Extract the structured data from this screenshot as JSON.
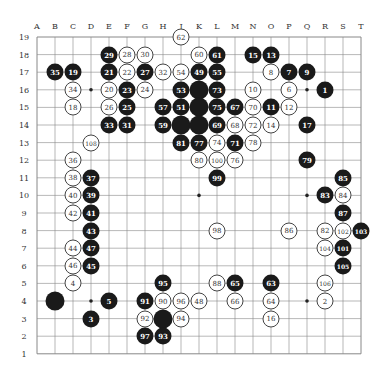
{
  "diagram": {
    "type": "go-game-record",
    "board_size": 19,
    "columns": [
      "A",
      "B",
      "C",
      "D",
      "E",
      "F",
      "G",
      "H",
      "J",
      "K",
      "L",
      "M",
      "N",
      "O",
      "P",
      "Q",
      "R",
      "S",
      "T"
    ],
    "rows": [
      19,
      18,
      17,
      16,
      15,
      14,
      13,
      12,
      11,
      10,
      9,
      8,
      7,
      6,
      5,
      4,
      3,
      2,
      1
    ],
    "star_points": [
      "D4",
      "K4",
      "Q4",
      "D10",
      "K10",
      "Q10",
      "D16",
      "K16",
      "Q16"
    ],
    "stones": [
      {
        "pos": "J19",
        "color": "white",
        "label": "62"
      },
      {
        "pos": "E18",
        "color": "black",
        "label": "29"
      },
      {
        "pos": "F18",
        "color": "white",
        "label": "28"
      },
      {
        "pos": "G18",
        "color": "white",
        "label": "30"
      },
      {
        "pos": "K18",
        "color": "white",
        "label": "60"
      },
      {
        "pos": "L18",
        "color": "black",
        "label": "61"
      },
      {
        "pos": "N18",
        "color": "black",
        "label": "15"
      },
      {
        "pos": "O18",
        "color": "black",
        "label": "13"
      },
      {
        "pos": "B17",
        "color": "black",
        "label": "35"
      },
      {
        "pos": "C17",
        "color": "black",
        "label": "19"
      },
      {
        "pos": "E17",
        "color": "black",
        "label": "21"
      },
      {
        "pos": "F17",
        "color": "white",
        "label": "22"
      },
      {
        "pos": "G17",
        "color": "black",
        "label": "27"
      },
      {
        "pos": "H17",
        "color": "white",
        "label": "32"
      },
      {
        "pos": "J17",
        "color": "white",
        "label": "54"
      },
      {
        "pos": "K17",
        "color": "black",
        "label": "49"
      },
      {
        "pos": "L17",
        "color": "black",
        "label": "55"
      },
      {
        "pos": "O17",
        "color": "white",
        "label": "8"
      },
      {
        "pos": "P17",
        "color": "black",
        "label": "7"
      },
      {
        "pos": "Q17",
        "color": "black",
        "label": "9"
      },
      {
        "pos": "C16",
        "color": "white",
        "label": "34"
      },
      {
        "pos": "E16",
        "color": "white",
        "label": "20"
      },
      {
        "pos": "F16",
        "color": "black",
        "label": "23"
      },
      {
        "pos": "G16",
        "color": "white",
        "label": "24"
      },
      {
        "pos": "J16",
        "color": "black",
        "label": "53"
      },
      {
        "pos": "K16",
        "color": "black",
        "label": ""
      },
      {
        "pos": "L16",
        "color": "black",
        "label": "73"
      },
      {
        "pos": "N16",
        "color": "white",
        "label": "10"
      },
      {
        "pos": "P16",
        "color": "white",
        "label": "6"
      },
      {
        "pos": "R16",
        "color": "black",
        "label": "1"
      },
      {
        "pos": "C15",
        "color": "white",
        "label": "18"
      },
      {
        "pos": "E15",
        "color": "white",
        "label": "26"
      },
      {
        "pos": "F15",
        "color": "black",
        "label": "25"
      },
      {
        "pos": "H15",
        "color": "black",
        "label": "57"
      },
      {
        "pos": "J15",
        "color": "black",
        "label": "51"
      },
      {
        "pos": "K15",
        "color": "black",
        "label": ""
      },
      {
        "pos": "L15",
        "color": "black",
        "label": "75"
      },
      {
        "pos": "M15",
        "color": "black",
        "label": "67"
      },
      {
        "pos": "N15",
        "color": "white",
        "label": "70"
      },
      {
        "pos": "O15",
        "color": "black",
        "label": "11"
      },
      {
        "pos": "P15",
        "color": "white",
        "label": "12"
      },
      {
        "pos": "E14",
        "color": "black",
        "label": "33"
      },
      {
        "pos": "F14",
        "color": "black",
        "label": "31"
      },
      {
        "pos": "H14",
        "color": "black",
        "label": "59"
      },
      {
        "pos": "J14",
        "color": "black",
        "label": ""
      },
      {
        "pos": "K14",
        "color": "black",
        "label": ""
      },
      {
        "pos": "L14",
        "color": "black",
        "label": "69"
      },
      {
        "pos": "M14",
        "color": "white",
        "label": "68"
      },
      {
        "pos": "N14",
        "color": "white",
        "label": "72"
      },
      {
        "pos": "O14",
        "color": "white",
        "label": "14"
      },
      {
        "pos": "Q14",
        "color": "black",
        "label": "17"
      },
      {
        "pos": "D13",
        "color": "white",
        "label": "108"
      },
      {
        "pos": "J13",
        "color": "black",
        "label": "81"
      },
      {
        "pos": "K13",
        "color": "black",
        "label": "77"
      },
      {
        "pos": "L13",
        "color": "white",
        "label": "74"
      },
      {
        "pos": "M13",
        "color": "black",
        "label": "71"
      },
      {
        "pos": "N13",
        "color": "white",
        "label": "78"
      },
      {
        "pos": "C12",
        "color": "white",
        "label": "36"
      },
      {
        "pos": "K12",
        "color": "white",
        "label": "80"
      },
      {
        "pos": "L12",
        "color": "white",
        "label": "100"
      },
      {
        "pos": "M12",
        "color": "white",
        "label": "76"
      },
      {
        "pos": "Q12",
        "color": "black",
        "label": "79"
      },
      {
        "pos": "C11",
        "color": "white",
        "label": "38"
      },
      {
        "pos": "D11",
        "color": "black",
        "label": "37"
      },
      {
        "pos": "L11",
        "color": "black",
        "label": "99"
      },
      {
        "pos": "S11",
        "color": "black",
        "label": "85"
      },
      {
        "pos": "C10",
        "color": "white",
        "label": "40"
      },
      {
        "pos": "D10",
        "color": "black",
        "label": "39"
      },
      {
        "pos": "R10",
        "color": "black",
        "label": "83"
      },
      {
        "pos": "S10",
        "color": "white",
        "label": "84"
      },
      {
        "pos": "C9",
        "color": "white",
        "label": "42"
      },
      {
        "pos": "D9",
        "color": "black",
        "label": "41"
      },
      {
        "pos": "S9",
        "color": "black",
        "label": "87"
      },
      {
        "pos": "D8",
        "color": "black",
        "label": "43"
      },
      {
        "pos": "L8",
        "color": "white",
        "label": "98"
      },
      {
        "pos": "P8",
        "color": "white",
        "label": "86"
      },
      {
        "pos": "R8",
        "color": "white",
        "label": "82"
      },
      {
        "pos": "S8",
        "color": "white",
        "label": "102"
      },
      {
        "pos": "T8",
        "color": "black",
        "label": "103"
      },
      {
        "pos": "C7",
        "color": "white",
        "label": "44"
      },
      {
        "pos": "D7",
        "color": "black",
        "label": "47"
      },
      {
        "pos": "R7",
        "color": "white",
        "label": "104"
      },
      {
        "pos": "S7",
        "color": "black",
        "label": "101"
      },
      {
        "pos": "C6",
        "color": "white",
        "label": "46"
      },
      {
        "pos": "D6",
        "color": "black",
        "label": "45"
      },
      {
        "pos": "S6",
        "color": "black",
        "label": "105"
      },
      {
        "pos": "C5",
        "color": "white",
        "label": "4"
      },
      {
        "pos": "H5",
        "color": "black",
        "label": "95"
      },
      {
        "pos": "L5",
        "color": "white",
        "label": "88"
      },
      {
        "pos": "M5",
        "color": "black",
        "label": "65"
      },
      {
        "pos": "O5",
        "color": "black",
        "label": "63"
      },
      {
        "pos": "R5",
        "color": "white",
        "label": "106"
      },
      {
        "pos": "B4",
        "color": "black",
        "label": ""
      },
      {
        "pos": "E4",
        "color": "black",
        "label": "5"
      },
      {
        "pos": "G4",
        "color": "black",
        "label": "91"
      },
      {
        "pos": "H4",
        "color": "white",
        "label": "90"
      },
      {
        "pos": "J4",
        "color": "white",
        "label": "96"
      },
      {
        "pos": "K4",
        "color": "white",
        "label": "48"
      },
      {
        "pos": "M4",
        "color": "white",
        "label": "66"
      },
      {
        "pos": "O4",
        "color": "white",
        "label": "64"
      },
      {
        "pos": "R4",
        "color": "white",
        "label": "2"
      },
      {
        "pos": "D3",
        "color": "black",
        "label": "3"
      },
      {
        "pos": "G3",
        "color": "white",
        "label": "92"
      },
      {
        "pos": "H3",
        "color": "black",
        "label": ""
      },
      {
        "pos": "J3",
        "color": "white",
        "label": "94"
      },
      {
        "pos": "O3",
        "color": "white",
        "label": "16"
      },
      {
        "pos": "G2",
        "color": "black",
        "label": "97"
      },
      {
        "pos": "H2",
        "color": "black",
        "label": "93"
      }
    ]
  },
  "colors": {
    "black_stone": "#1a1a1a",
    "white_stone": "#ffffff",
    "grid_line": "#888888",
    "background": "#ffffff"
  }
}
